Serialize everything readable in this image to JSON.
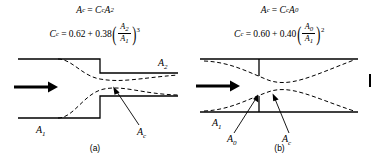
{
  "figure": {
    "background_color": "#ffffff",
    "line_color": "#000000",
    "edge_tick_name": "page-edge-mark"
  },
  "panels": [
    {
      "id": "a",
      "caption": "(a)",
      "type": "sudden-expansion",
      "formulas": {
        "line1": {
          "lhs_var": "A",
          "lhs_sub": "c",
          "equals": "=",
          "rhs_coeff_var": "C",
          "rhs_coeff_sub": "c",
          "rhs_area_var": "A",
          "rhs_area_sub": "2",
          "plain": "A_c = C_c A_2"
        },
        "line2": {
          "lhs_var": "C",
          "lhs_sub": "c",
          "equals": "=",
          "const": "0.62",
          "plus": "+",
          "factor": "0.38",
          "frac_num_var": "A",
          "frac_num_sub": "2",
          "frac_den_var": "A",
          "frac_den_sub": "1",
          "exponent": "3",
          "plain": "C_c = 0.62 + 0.38 (A_2/A_1)^3"
        }
      },
      "labels": {
        "outlet_area": "A",
        "outlet_area_sub": "2",
        "inlet_area": "A",
        "inlet_area_sub": "1",
        "contracted_area": "A",
        "contracted_area_sub": "c"
      },
      "flow_arrow": "flow-direction-arrow"
    },
    {
      "id": "b",
      "caption": "(b)",
      "type": "orifice-plate",
      "formulas": {
        "line1": {
          "lhs_var": "A",
          "lhs_sub": "c",
          "equals": "=",
          "rhs_coeff_var": "C",
          "rhs_coeff_sub": "c",
          "rhs_area_var": "A",
          "rhs_area_sub": "0",
          "plain": "A_c = C_c A_0"
        },
        "line2": {
          "lhs_var": "C",
          "lhs_sub": "c",
          "equals": "=",
          "const": "0.60",
          "plus": "+",
          "factor": "0.40",
          "frac_num_var": "A",
          "frac_num_sub": "0",
          "frac_den_var": "A",
          "frac_den_sub": "1",
          "exponent": "2",
          "plain": "C_c = 0.60 + 0.40 (A_0/A_1)^2"
        }
      },
      "labels": {
        "inlet_area": "A",
        "inlet_area_sub": "1",
        "orifice_area": "A",
        "orifice_area_sub": "0",
        "contracted_area": "A",
        "contracted_area_sub": "c"
      },
      "flow_arrow": "flow-direction-arrow"
    }
  ]
}
